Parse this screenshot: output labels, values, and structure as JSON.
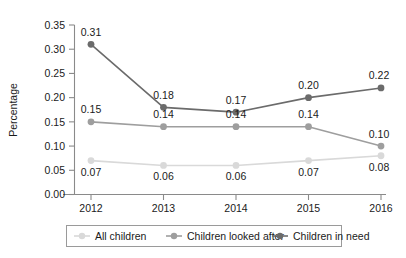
{
  "chart_data": {
    "type": "line",
    "title": "",
    "xlabel": "",
    "ylabel": "Percentage",
    "categories": [
      "2012",
      "2013",
      "2014",
      "2015",
      "2016"
    ],
    "ylim": [
      0.0,
      0.35
    ],
    "ytick_labels": [
      "0.35",
      "0.30",
      "0.25",
      "0.20",
      "0.15",
      "0.10",
      "0.05",
      "0.00"
    ],
    "ytick_values": [
      0.35,
      0.3,
      0.25,
      0.2,
      0.15,
      0.1,
      0.05,
      0.0
    ],
    "grid": false,
    "legend_position": "bottom",
    "series": [
      {
        "name": "All children",
        "color": "#d9d9d9",
        "values": [
          0.07,
          0.06,
          0.06,
          0.07,
          0.08
        ],
        "labels": [
          "0.07",
          "0.06",
          "0.06",
          "0.07",
          "0.08"
        ],
        "label_side": "below"
      },
      {
        "name": "Children looked after",
        "color": "#9e9e9e",
        "values": [
          0.15,
          0.14,
          0.14,
          0.14,
          0.1
        ],
        "labels": [
          "0.15",
          "0.14",
          "0.14",
          "0.14",
          "0.10"
        ],
        "label_side": "above"
      },
      {
        "name": "Children in need",
        "color": "#6b6b6b",
        "values": [
          0.31,
          0.18,
          0.17,
          0.2,
          0.22
        ],
        "labels": [
          "0.31",
          "0.18",
          "0.17",
          "0.20",
          "0.22"
        ],
        "label_side": "above"
      }
    ]
  },
  "legend": {
    "items": [
      {
        "label": "All children",
        "color": "#d9d9d9"
      },
      {
        "label": "Children looked after",
        "color": "#9e9e9e"
      },
      {
        "label": "Children in need",
        "color": "#6b6b6b"
      }
    ]
  }
}
